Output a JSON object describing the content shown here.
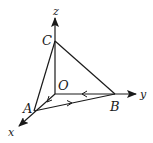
{
  "diagram": {
    "type": "3d-coordinate-tetrahedron",
    "colors": {
      "line": "#1a1a1a",
      "background": "#ffffff"
    },
    "axes": {
      "x": {
        "label": "x"
      },
      "y": {
        "label": "y"
      },
      "z": {
        "label": "z"
      }
    },
    "points": {
      "O": {
        "label": "O"
      },
      "A": {
        "label": "A"
      },
      "B": {
        "label": "B"
      },
      "C": {
        "label": "C"
      }
    },
    "edges": [
      {
        "from": "C",
        "to": "A"
      },
      {
        "from": "C",
        "to": "B"
      },
      {
        "from": "O",
        "to": "C"
      },
      {
        "from": "O",
        "to": "A",
        "arrow": "toward A"
      },
      {
        "from": "B",
        "to": "O",
        "arrow": "toward O"
      },
      {
        "from": "A",
        "to": "B",
        "arrow": "toward B"
      }
    ]
  }
}
